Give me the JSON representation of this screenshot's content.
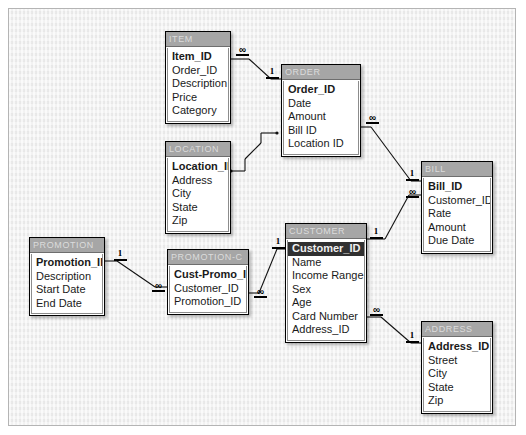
{
  "diagram": {
    "type": "er-diagram",
    "background_color": "#eeeeee",
    "table_header_color": "#a6a6a6",
    "selection_color": "#303030"
  },
  "tables": [
    {
      "id": "item",
      "name": "ITEM",
      "fields": [
        {
          "label": "Item_ID",
          "primary_key": true,
          "selected": false
        },
        {
          "label": "Order_ID",
          "primary_key": false,
          "selected": false
        },
        {
          "label": "Description",
          "primary_key": false,
          "selected": false
        },
        {
          "label": "Price",
          "primary_key": false,
          "selected": false
        },
        {
          "label": "Category",
          "primary_key": false,
          "selected": false
        }
      ]
    },
    {
      "id": "order",
      "name": "ORDER",
      "fields": [
        {
          "label": "Order_ID",
          "primary_key": true,
          "selected": false
        },
        {
          "label": "Date",
          "primary_key": false,
          "selected": false
        },
        {
          "label": "Amount",
          "primary_key": false,
          "selected": false
        },
        {
          "label": "Bill ID",
          "primary_key": false,
          "selected": false
        },
        {
          "label": "Location ID",
          "primary_key": false,
          "selected": false
        }
      ]
    },
    {
      "id": "location",
      "name": "LOCATION",
      "fields": [
        {
          "label": "Location_ID",
          "primary_key": true,
          "selected": false
        },
        {
          "label": "Address",
          "primary_key": false,
          "selected": false
        },
        {
          "label": "City",
          "primary_key": false,
          "selected": false
        },
        {
          "label": "State",
          "primary_key": false,
          "selected": false
        },
        {
          "label": "Zip",
          "primary_key": false,
          "selected": false
        }
      ]
    },
    {
      "id": "bill",
      "name": "BILL",
      "fields": [
        {
          "label": "Bill_ID",
          "primary_key": true,
          "selected": false
        },
        {
          "label": "Customer_ID",
          "primary_key": false,
          "selected": false
        },
        {
          "label": "Rate",
          "primary_key": false,
          "selected": false
        },
        {
          "label": "Amount",
          "primary_key": false,
          "selected": false
        },
        {
          "label": "Due Date",
          "primary_key": false,
          "selected": false
        }
      ]
    },
    {
      "id": "customer",
      "name": "CUSTOMER",
      "fields": [
        {
          "label": "Customer_ID",
          "primary_key": true,
          "selected": true
        },
        {
          "label": "Name",
          "primary_key": false,
          "selected": false
        },
        {
          "label": "Income Range",
          "primary_key": false,
          "selected": false
        },
        {
          "label": "Sex",
          "primary_key": false,
          "selected": false
        },
        {
          "label": "Age",
          "primary_key": false,
          "selected": false
        },
        {
          "label": "Card Number",
          "primary_key": false,
          "selected": false
        },
        {
          "label": "Address_ID",
          "primary_key": false,
          "selected": false
        }
      ]
    },
    {
      "id": "address",
      "name": "ADDRESS",
      "fields": [
        {
          "label": "Address_ID",
          "primary_key": true,
          "selected": false
        },
        {
          "label": "Street",
          "primary_key": false,
          "selected": false
        },
        {
          "label": "City",
          "primary_key": false,
          "selected": false
        },
        {
          "label": "State",
          "primary_key": false,
          "selected": false
        },
        {
          "label": "Zip",
          "primary_key": false,
          "selected": false
        }
      ]
    },
    {
      "id": "promotion",
      "name": "PROMOTION",
      "fields": [
        {
          "label": "Promotion_ID",
          "primary_key": true,
          "selected": false
        },
        {
          "label": "Description",
          "primary_key": false,
          "selected": false
        },
        {
          "label": "Start Date",
          "primary_key": false,
          "selected": false
        },
        {
          "label": "End Date",
          "primary_key": false,
          "selected": false
        }
      ]
    },
    {
      "id": "promotion_c",
      "name": "PROMOTION-C",
      "fields": [
        {
          "label": "Cust-Promo_ID",
          "primary_key": true,
          "selected": false
        },
        {
          "label": "Customer_ID",
          "primary_key": false,
          "selected": false
        },
        {
          "label": "Promotion_ID",
          "primary_key": false,
          "selected": false
        }
      ]
    }
  ],
  "relationships": [
    {
      "id": "item-order",
      "from": "ITEM",
      "to": "ORDER",
      "from_cardinality": "∞",
      "to_cardinality": "1"
    },
    {
      "id": "location-order",
      "from": "LOCATION",
      "to": "ORDER",
      "from_cardinality": "1",
      "to_cardinality": "∞"
    },
    {
      "id": "order-bill",
      "from": "ORDER",
      "to": "BILL",
      "from_cardinality": "∞",
      "to_cardinality": "1"
    },
    {
      "id": "customer-bill",
      "from": "CUSTOMER",
      "to": "BILL",
      "from_cardinality": "1",
      "to_cardinality": "∞"
    },
    {
      "id": "customer-address",
      "from": "CUSTOMER",
      "to": "ADDRESS",
      "from_cardinality": "∞",
      "to_cardinality": "1"
    },
    {
      "id": "promotion-promotionc",
      "from": "PROMOTION",
      "to": "PROMOTION-C",
      "from_cardinality": "1",
      "to_cardinality": "∞"
    },
    {
      "id": "promotionc-customer",
      "from": "PROMOTION-C",
      "to": "CUSTOMER",
      "from_cardinality": "∞",
      "to_cardinality": "1"
    }
  ],
  "cardinality_labels": {
    "one": "1",
    "many": "∞"
  }
}
